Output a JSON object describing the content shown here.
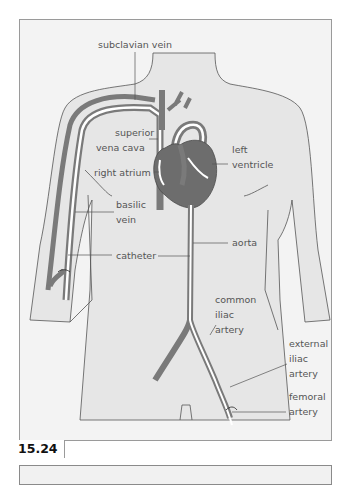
{
  "figure": {
    "number": "15.24",
    "type": "anatomical illustration"
  },
  "labels": {
    "subclavian_vein": "subclavian vein",
    "superior_vena_cava_1": "superior",
    "superior_vena_cava_2": "vena cava",
    "right_atrium": "right atrium",
    "left_ventricle_1": "left",
    "left_ventricle_2": "ventricle",
    "basilic_vein_1": "basilic",
    "basilic_vein_2": "vein",
    "catheter": "catheter",
    "aorta": "aorta",
    "common_iliac_1": "common",
    "common_iliac_2": "iliac",
    "common_iliac_3": "artery",
    "external_iliac_1": "external",
    "external_iliac_2": "iliac",
    "external_iliac_3": "artery",
    "femoral_1": "femoral",
    "femoral_2": "artery"
  },
  "colors": {
    "vessel": "#7a7a7a",
    "vessel_dark": "#5f5f5f",
    "body_fill": "#e6e6e6",
    "background": "#f3f3f3",
    "outline": "#555555",
    "catheter": "#ffffff"
  }
}
